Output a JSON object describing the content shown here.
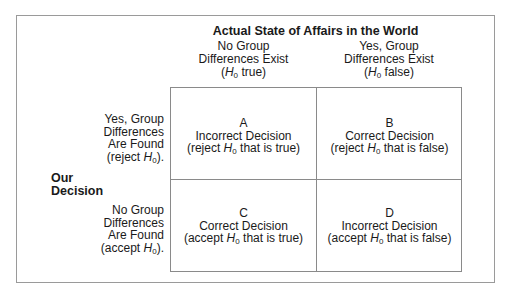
{
  "title": "Actual State of Affairs in the World",
  "side_label": {
    "line1": "Our",
    "line2": "Decision"
  },
  "columns": [
    {
      "line1": "No Group",
      "line2": "Differences Exist",
      "pre": "(",
      "h": "H",
      "sub": "0",
      "post": " true)"
    },
    {
      "line1": "Yes, Group",
      "line2": "Differences Exist",
      "pre": "(",
      "h": "H",
      "sub": "0",
      "post": " false)"
    }
  ],
  "rows": [
    {
      "line1": "Yes, Group",
      "line2": "Differences",
      "line3": "Are Found",
      "pre": "(reject ",
      "h": "H",
      "sub": "0",
      "post": ")."
    },
    {
      "line1": "No Group",
      "line2": "Differences",
      "line3": "Are Found",
      "pre": "(accept ",
      "h": "H",
      "sub": "0",
      "post": ")."
    }
  ],
  "cells": [
    {
      "letter": "A",
      "label": "Incorrect Decision",
      "pre": "(reject ",
      "h": "H",
      "sub": "0",
      "post": " that is true)"
    },
    {
      "letter": "B",
      "label": "Correct Decision",
      "pre": "(reject ",
      "h": "H",
      "sub": "0",
      "post": " that is false)"
    },
    {
      "letter": "C",
      "label": "Correct Decision",
      "pre": "(accept ",
      "h": "H",
      "sub": "0",
      "post": " that is true)"
    },
    {
      "letter": "D",
      "label": "Incorrect Decision",
      "pre": "(accept ",
      "h": "H",
      "sub": "0",
      "post": " that is false)"
    }
  ]
}
